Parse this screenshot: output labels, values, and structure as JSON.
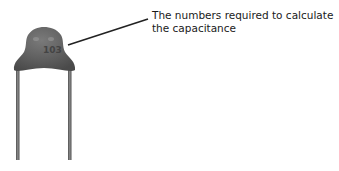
{
  "annotation": {
    "line1": "The numbers required to calculate",
    "line2": "the capacitance"
  },
  "component": {
    "name": "ceramic-disc-capacitor",
    "marking": "103",
    "body_color": "#5e5e5e",
    "lead_color": "#6a6a6a"
  },
  "leader_line": {
    "x1": 68,
    "y1": 45,
    "x2": 148,
    "y2": 19,
    "color": "#222222"
  }
}
